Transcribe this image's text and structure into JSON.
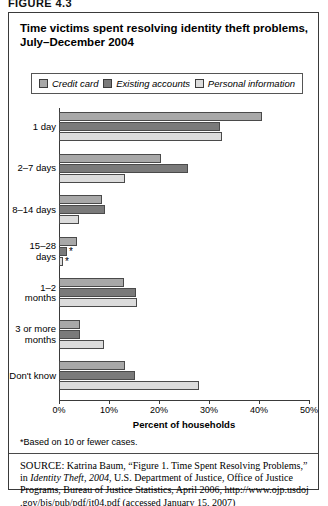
{
  "figure_label": "FIGURE 4.3",
  "title": "Time victims spent resolving identity theft problems, July–December 2004",
  "legend": {
    "items": [
      {
        "label": "Credit card",
        "color": "#a8a8a8",
        "name": "credit-card"
      },
      {
        "label": "Existing accounts",
        "color": "#7a7a7a",
        "name": "existing-accounts"
      },
      {
        "label": "Personal information",
        "color": "#dcdcdc",
        "name": "personal-information"
      }
    ]
  },
  "footnote": "*Based on 10 or fewer cases.",
  "source": {
    "label": "SOURCE:",
    "text_1": " Katrina Baum, “Figure 1. Time Spent Resolving Problems,” in ",
    "italic": "Identity Theft, 2004",
    "text_2": ", U.S. Department of Justice, Office of Justice Programs, Bureau of Justice Statistics, April 2006, http://www.ojp.usdoj .gov/bjs/pub/pdf/it04.pdf (accessed January 15, 2007)"
  },
  "chart_data": {
    "type": "bar",
    "orientation": "horizontal",
    "title": "Time victims spent resolving identity theft problems, July–December 2004",
    "xlabel": "Percent of households",
    "ylabel": "",
    "xlim": [
      0,
      50
    ],
    "xticks": [
      "0%",
      "10%",
      "20%",
      "30%",
      "40%",
      "50%"
    ],
    "xtick_values": [
      0,
      10,
      20,
      30,
      40,
      50
    ],
    "grid": false,
    "legend_position": "top",
    "categories": [
      "1 day",
      "2–7 days",
      "8–14 days",
      "15–28 days",
      "1–2 months",
      "3 or more months",
      "Don't know"
    ],
    "series": [
      {
        "name": "Credit card",
        "color": "#a8a8a8",
        "values": [
          40.6,
          20.3,
          8.5,
          3.6,
          13.0,
          4.2,
          13.1
        ],
        "footnote_flags": [
          false,
          false,
          false,
          false,
          false,
          false,
          false
        ]
      },
      {
        "name": "Existing accounts",
        "color": "#7a7a7a",
        "values": [
          32.1,
          25.8,
          9.1,
          1.6,
          15.3,
          4.2,
          15.2
        ],
        "footnote_flags": [
          false,
          false,
          false,
          true,
          false,
          false,
          false
        ]
      },
      {
        "name": "Personal information",
        "color": "#dcdcdc",
        "values": [
          32.5,
          13.2,
          4.0,
          0.8,
          15.5,
          9.0,
          28.0
        ],
        "footnote_flags": [
          false,
          false,
          false,
          true,
          false,
          false,
          false
        ]
      }
    ]
  }
}
